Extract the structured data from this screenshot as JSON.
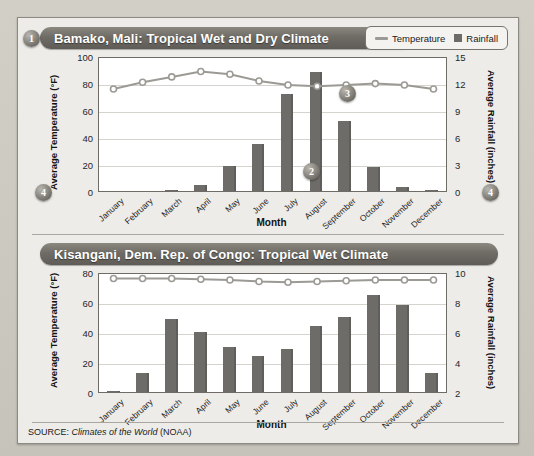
{
  "figure": {
    "source_prefix": "SOURCE:",
    "source_title": "Climates of the World",
    "source_suffix": "(NOAA)"
  },
  "legend": {
    "temperature_label": "Temperature",
    "rainfall_label": "Rainfall",
    "line_color": "#9c9a95",
    "bar_color": "#6e6c68"
  },
  "callouts": [
    {
      "id": "callout-1",
      "label": "1"
    },
    {
      "id": "callout-2",
      "label": "2"
    },
    {
      "id": "callout-3",
      "label": "3"
    },
    {
      "id": "callout-4-top",
      "label": "4"
    },
    {
      "id": "callout-4-top-right",
      "label": "4"
    },
    {
      "id": "callout-4-bottom",
      "label": "4"
    }
  ],
  "chart_data": [
    {
      "type": "bar",
      "title": "Bamako, Mali: Tropical Wet and Dry Climate",
      "xlabel": "Month",
      "ylabel": "Average Temperature (°F)",
      "y2label": "Average Rainfall (inches)",
      "categories": [
        "January",
        "February",
        "March",
        "April",
        "May",
        "June",
        "July",
        "August",
        "September",
        "October",
        "November",
        "December"
      ],
      "ylim": [
        0,
        100
      ],
      "yticks": [
        0,
        20,
        40,
        60,
        80,
        100
      ],
      "y2lim": [
        0,
        15
      ],
      "y2ticks": [
        0,
        3,
        6,
        9,
        12,
        15
      ],
      "grid": true,
      "legend_position": "top-right",
      "series": [
        {
          "name": "Rainfall",
          "axis": "right",
          "type": "bar",
          "unit": "inches",
          "values": [
            0.0,
            0.0,
            0.1,
            0.7,
            2.8,
            5.2,
            10.8,
            13.2,
            7.8,
            2.7,
            0.5,
            0.1
          ]
        },
        {
          "name": "Temperature",
          "axis": "left",
          "type": "line",
          "unit": "°F",
          "values": [
            77,
            82,
            86,
            90,
            88,
            83,
            80,
            79,
            80,
            81,
            80,
            77
          ]
        }
      ]
    },
    {
      "type": "bar",
      "title": "Kisangani, Dem. Rep. of Congo: Tropical Wet Climate",
      "xlabel": "Month",
      "ylabel": "Average Temperature (°F)",
      "y2label": "Average Rainfall (inches)",
      "categories": [
        "January",
        "February",
        "March",
        "April",
        "May",
        "June",
        "July",
        "August",
        "September",
        "October",
        "November",
        "December"
      ],
      "ylim": [
        0,
        80
      ],
      "yticks": [
        0,
        20,
        40,
        60,
        80
      ],
      "y2lim": [
        2,
        10
      ],
      "y2ticks": [
        2,
        4,
        6,
        8,
        10
      ],
      "grid": true,
      "legend_position": "none",
      "series": [
        {
          "name": "Rainfall",
          "axis": "right",
          "type": "bar",
          "unit": "inches",
          "values": [
            2.1,
            3.3,
            6.9,
            6.0,
            5.0,
            4.4,
            4.9,
            6.4,
            7.0,
            8.5,
            7.8,
            3.3
          ]
        },
        {
          "name": "Temperature",
          "axis": "left",
          "type": "line",
          "unit": "°F",
          "values": [
            77,
            77,
            77,
            76.5,
            76,
            75,
            74.5,
            75,
            75.5,
            76,
            76,
            76
          ]
        }
      ]
    }
  ]
}
